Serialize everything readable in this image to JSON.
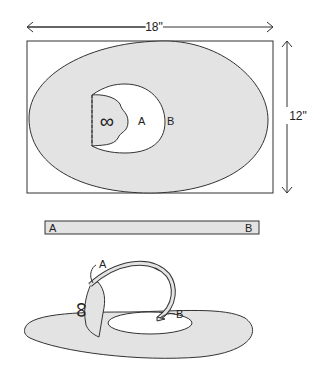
{
  "pattern": {
    "width_label": "18\"",
    "height_label": "12\"",
    "inner_label_a": "A",
    "inner_label_b": "B",
    "symbol": "∞"
  },
  "strap": {
    "label_a": "A",
    "label_b": "B"
  },
  "assembled": {
    "label_a": "A",
    "label_b": "B"
  },
  "colors": {
    "fill": "#e3e3e3",
    "line": "#333333",
    "background": "#ffffff"
  }
}
